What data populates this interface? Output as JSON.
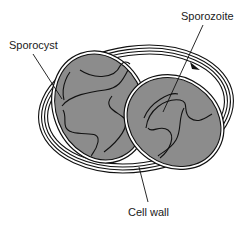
{
  "diagram": {
    "labels": {
      "sporocyst": "Sporocyst",
      "sporozoite": "Sporozoite",
      "cell_wall": "Cell wall"
    },
    "colors": {
      "sporocyst_fill": "#8c8c8c",
      "line": "#111111",
      "background": "#ffffff"
    },
    "structures": [
      {
        "name": "Cell wall",
        "count": 1
      },
      {
        "name": "Sporocyst",
        "count": 2
      },
      {
        "name": "Sporozoite",
        "count": 4
      }
    ]
  }
}
